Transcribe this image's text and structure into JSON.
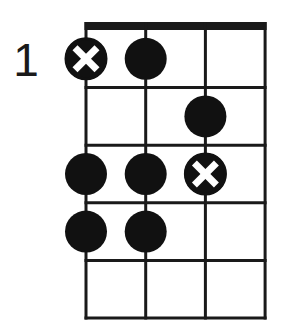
{
  "diagram": {
    "type": "fretboard-chord-diagram",
    "starting_fret_label": "1",
    "strings": 4,
    "frets_shown": 5,
    "colors": {
      "background": "#ffffff",
      "lines": "#1a1a1a",
      "dot": "#111111",
      "mark": "#ffffff"
    },
    "positions": [
      {
        "fret": 1,
        "string": 1,
        "kind": "x-dot"
      },
      {
        "fret": 1,
        "string": 2,
        "kind": "dot"
      },
      {
        "fret": 2,
        "string": 3,
        "kind": "dot"
      },
      {
        "fret": 3,
        "string": 1,
        "kind": "dot"
      },
      {
        "fret": 3,
        "string": 2,
        "kind": "dot"
      },
      {
        "fret": 3,
        "string": 3,
        "kind": "x-dot"
      },
      {
        "fret": 4,
        "string": 1,
        "kind": "dot"
      },
      {
        "fret": 4,
        "string": 2,
        "kind": "dot"
      }
    ]
  }
}
